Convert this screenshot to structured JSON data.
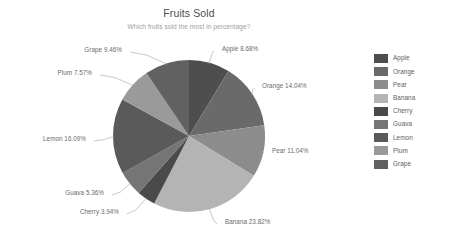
{
  "chart_data": {
    "type": "pie",
    "title": "Fruits Sold",
    "subtitle": "Which fruits sold the most in percentage?",
    "xlabel": "",
    "ylabel": "",
    "legend_position": "right",
    "grid": false,
    "start_angle_deg": 0,
    "direction": "clockwise",
    "categories": [
      "Apple",
      "Orange",
      "Pear",
      "Banana",
      "Cherry",
      "Guava",
      "Lemon",
      "Plum",
      "Grape"
    ],
    "values": [
      8.68,
      14.04,
      11.04,
      23.82,
      3.94,
      5.36,
      16.09,
      7.57,
      9.46
    ],
    "unit": "%",
    "slices": [
      {
        "name": "Apple",
        "value": 8.68,
        "label": "Apple 8.68%",
        "color": "#4e4e4e"
      },
      {
        "name": "Orange",
        "value": 14.04,
        "label": "Orange 14.04%",
        "color": "#6a6a6a"
      },
      {
        "name": "Pear",
        "value": 11.04,
        "label": "Pear 11.04%",
        "color": "#8c8c8c"
      },
      {
        "name": "Banana",
        "value": 23.82,
        "label": "Banana 23.82%",
        "color": "#b4b4b4"
      },
      {
        "name": "Cherry",
        "value": 3.94,
        "label": "Cherry 3.94%",
        "color": "#4a4a4a"
      },
      {
        "name": "Guava",
        "value": 5.36,
        "label": "Guava 5.36%",
        "color": "#757575"
      },
      {
        "name": "Lemon",
        "value": 16.09,
        "label": "Lemon 16.09%",
        "color": "#5a5a5a"
      },
      {
        "name": "Plum",
        "value": 7.57,
        "label": "Plum 7.57%",
        "color": "#9a9a9a"
      },
      {
        "name": "Grape",
        "value": 9.46,
        "label": "Grape 9.46%",
        "color": "#616161"
      }
    ]
  },
  "legend": {
    "items": [
      {
        "label": "Apple",
        "color": "#4e4e4e"
      },
      {
        "label": "Orange",
        "color": "#6a6a6a"
      },
      {
        "label": "Pear",
        "color": "#8c8c8c"
      },
      {
        "label": "Banana",
        "color": "#b4b4b4"
      },
      {
        "label": "Cherry",
        "color": "#4a4a4a"
      },
      {
        "label": "Guava",
        "color": "#757575"
      },
      {
        "label": "Lemon",
        "color": "#5a5a5a"
      },
      {
        "label": "Plum",
        "color": "#9a9a9a"
      },
      {
        "label": "Grape",
        "color": "#616161"
      }
    ]
  },
  "theme": {
    "background": "#ffffff",
    "title_color": "#4c4c4c",
    "subtitle_color": "#a0a0a0",
    "label_color": "#6b6b6b",
    "leader_line_color": "#b0b0b0"
  }
}
